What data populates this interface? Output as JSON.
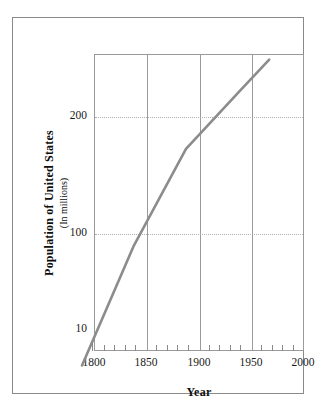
{
  "chart_data": {
    "type": "line",
    "title": "",
    "xlabel": "Year",
    "ylabel": "Population of United States",
    "ylabel_sub": "(In millions)",
    "yscale": "log",
    "xlim": [
      1800,
      2000
    ],
    "ylim": [
      8,
      300
    ],
    "grid": "vertical solid at 1850/1900/1950; horizontal dotted at 100 and 200",
    "legend": "none",
    "x_ticks": [
      1800,
      1850,
      1900,
      1950,
      2000
    ],
    "x_tick_labels": [
      "1800",
      "1850",
      "1900",
      "1950",
      "2000"
    ],
    "x_minor_tick_interval": 10,
    "y_ticks": [
      10,
      100,
      200
    ],
    "y_tick_labels": [
      "10",
      "100",
      "200"
    ],
    "series": [
      {
        "name": "Population of United States",
        "color": "#8c8c8c",
        "x": [
          1800,
          1850,
          1900,
          1950,
          1980
        ],
        "values": [
          5.3,
          23.2,
          76.0,
          151.0,
          227.0
        ]
      }
    ]
  },
  "axes": {
    "x_title": "Year",
    "y_title_main": "Population of United States",
    "y_title_sub": "(In millions)",
    "x_tick_labels": [
      "1800",
      "1850",
      "1900",
      "1950",
      "2000"
    ],
    "y_tick_labels": [
      "200",
      "100",
      "10"
    ]
  },
  "colors": {
    "series_line": "#8c8c8c",
    "plot_border": "#9a9a9a",
    "grid_vertical": "#9a9a9a",
    "grid_horizontal": "#b0b0b0",
    "outer_frame": "#8a8a8a",
    "text": "#1a1a1a",
    "background": "#ffffff"
  }
}
